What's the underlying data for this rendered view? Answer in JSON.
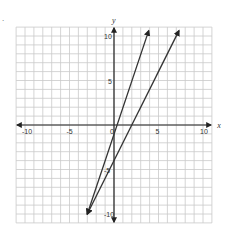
{
  "marker": ".",
  "chart_data": {
    "type": "line",
    "title": "",
    "xlabel": "x",
    "ylabel": "y",
    "xlim": [
      -11,
      11
    ],
    "ylim": [
      -11,
      11
    ],
    "grid": true,
    "x_ticks": [
      "-10",
      "-5",
      "0",
      "5",
      "10"
    ],
    "y_ticks": [
      "10",
      "5",
      "-5",
      "-10"
    ],
    "series": [
      {
        "name": "line A (steeper)",
        "equation": "y = 3x - 1",
        "points": [
          [
            -3,
            -10
          ],
          [
            3.9,
            10.6
          ]
        ]
      },
      {
        "name": "line B",
        "equation": "y = 2x - 4",
        "points": [
          [
            -3,
            -10
          ],
          [
            7.3,
            10.6
          ]
        ]
      }
    ],
    "intersection": [
      -3,
      -10
    ]
  },
  "colors": {
    "grid": "#c9c9c9",
    "axis": "#222222",
    "line": "#333333"
  }
}
